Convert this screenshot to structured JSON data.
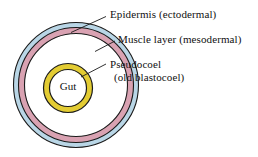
{
  "figure": {
    "type": "cross-section-diagram",
    "background_color": "#ffffff"
  },
  "labels": {
    "epidermis": "Epidermis (ectodermal)",
    "muscle": "Muscle layer (mesodermal)",
    "pseudocoel_line1": "Pseudocoel",
    "pseudocoel_line2": "(old blastocoel)",
    "gut": "Gut"
  },
  "structures": [
    {
      "name": "epidermis",
      "label": "Epidermis (ectodermal)",
      "shape": "outer-ring",
      "fill_color": "#b9d6e6",
      "stroke_color": "#1a1a1a",
      "center": [
        76,
        85
      ],
      "outer_radius": 63,
      "inner_radius": 58
    },
    {
      "name": "muscle-layer",
      "label": "Muscle layer (mesodermal)",
      "shape": "ring",
      "fill_color": "#d9a2b2",
      "stroke_color": "#1a1a1a",
      "center": [
        76,
        85
      ],
      "outer_radius": 58,
      "inner_radius": 52
    },
    {
      "name": "pseudocoel",
      "label": "Pseudocoel (old blastocoel)",
      "shape": "cavity",
      "fill_color": "#ffffff",
      "stroke_color": "#1a1a1a",
      "center": [
        76,
        85
      ],
      "outer_radius": 52
    },
    {
      "name": "gut",
      "label": "Gut",
      "shape": "ring",
      "fill_color": "#e3cc33",
      "stroke_color": "#1a1a1a",
      "center": [
        68,
        88
      ],
      "outer_radius": 25,
      "inner_radius": 19
    }
  ],
  "leader_lines": [
    {
      "name": "leader-epidermis",
      "from": [
        106,
        17
      ],
      "to": [
        72,
        32
      ]
    },
    {
      "name": "leader-muscle",
      "from": [
        114,
        41
      ],
      "to": [
        96,
        51
      ]
    },
    {
      "name": "leader-pseudocoel",
      "from": [
        106,
        64
      ],
      "to": [
        82,
        77
      ]
    }
  ],
  "colors": {
    "epidermis_blue": "#b9d6e6",
    "muscle_pink": "#d9a2b2",
    "gut_yellow": "#e3cc33",
    "outline": "#1a1a1a",
    "cavity_white": "#ffffff",
    "text": "#111111"
  }
}
